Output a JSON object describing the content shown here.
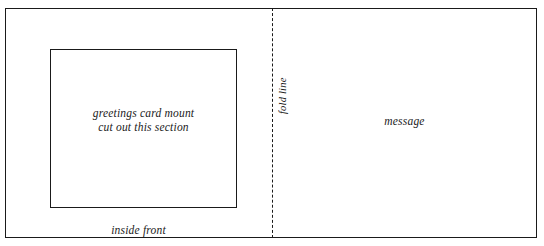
{
  "diagram": {
    "width": 544,
    "height": 246,
    "background_color": "#ffffff",
    "line_color": "#1a1a1a",
    "panels": {
      "left": {
        "name": "inside front",
        "label": "inside front",
        "mount": {
          "label_line_1": "greetings card mount",
          "label_line_2": "cut out this section"
        }
      },
      "right": {
        "name": "message",
        "label": "message"
      }
    },
    "fold": {
      "label": "fold line",
      "style": "dashed",
      "orientation": "vertical"
    }
  }
}
